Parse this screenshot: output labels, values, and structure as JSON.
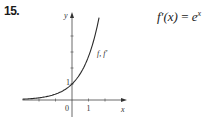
{
  "problem": {
    "number": "15."
  },
  "formula": {
    "lhs": "f′(x)",
    "eq": "=",
    "base": "e",
    "exp": "x"
  },
  "chart_data": {
    "type": "line",
    "title": "",
    "xlabel": "x",
    "ylabel": "y",
    "xlim": [
      -3,
      3
    ],
    "ylim": [
      0,
      5.3
    ],
    "x_ticks": [
      -2,
      -1,
      0,
      1,
      2
    ],
    "y_ticks": [
      1,
      2,
      3,
      4
    ],
    "tick_labels": {
      "origin": "0",
      "x_one": "1",
      "y_one": "1"
    },
    "series": [
      {
        "name": "f, f′",
        "function": "e^x",
        "x_range": [
          -3,
          1.64
        ]
      }
    ],
    "annotations": [
      {
        "text": "f, f′",
        "near_x": 1.3
      }
    ],
    "grid": false
  }
}
